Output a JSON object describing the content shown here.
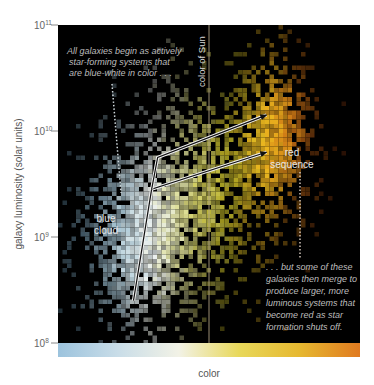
{
  "chart_data": {
    "type": "heatmap",
    "title": "",
    "xlabel": "color",
    "ylabel": "galaxy luminosity (solar units)",
    "y_scale": "log",
    "ylim": [
      100000000.0,
      100000000000.0
    ],
    "xlim": [
      "blue",
      "red"
    ],
    "y_ticks": [
      {
        "base": "10",
        "exp": "8",
        "value": 100000000.0
      },
      {
        "base": "10",
        "exp": "9",
        "value": 1000000000.0
      },
      {
        "base": "10",
        "exp": "10",
        "value": 10000000000.0
      },
      {
        "base": "10",
        "exp": "11",
        "value": 100000000000.0
      }
    ],
    "color_scale": [
      "#9cc3dd",
      "#c9dde8",
      "#f2f2e6",
      "#e8d85a",
      "#e6b830",
      "#e07a20"
    ],
    "regions": [
      {
        "name": "blue cloud",
        "label_lines": [
          "blue",
          "cloud"
        ],
        "color_position": 0.28,
        "log_luminosity": 9.15
      },
      {
        "name": "red sequence",
        "label_lines": [
          "red",
          "sequence"
        ],
        "color_position": 0.78,
        "log_luminosity": 9.75
      }
    ],
    "reference_lines": [
      {
        "name": "color of Sun",
        "color_position": 0.5
      }
    ],
    "annotations": [
      {
        "id": "blue-start",
        "lines": [
          "All galaxies begin as actively",
          "star-forming systems that",
          "are blue-white in color . . ."
        ]
      },
      {
        "id": "red-merge",
        "lines": [
          ". . . but some of these",
          "galaxies then merge to",
          "produce larger, more",
          "luminous systems that",
          "become red as star",
          "formation shuts off."
        ]
      }
    ],
    "evolution_arrows": [
      {
        "from": {
          "color_position": 0.25,
          "log_luminosity": 8.4
        },
        "via": {
          "color_position": 0.31,
          "log_luminosity": 9.45
        },
        "to": {
          "color_position": 0.69,
          "log_luminosity": 9.8
        }
      },
      {
        "from": {
          "color_position": 0.31,
          "log_luminosity": 9.45
        },
        "via": {
          "color_position": 0.33,
          "log_luminosity": 9.75
        },
        "to": {
          "color_position": 0.69,
          "log_luminosity": 10.15
        }
      }
    ],
    "density_model": [
      {
        "name": "blue cloud",
        "center_color": 0.26,
        "center_log_lum": 9.0,
        "spread_color": 0.11,
        "spread_log_lum": 0.55,
        "weight": 1.0
      },
      {
        "name": "green valley",
        "center_color": 0.5,
        "center_log_lum": 9.5,
        "spread_color": 0.12,
        "spread_log_lum": 0.6,
        "weight": 0.7
      },
      {
        "name": "red sequence",
        "center_color": 0.72,
        "center_log_lum": 10.0,
        "spread_color": 0.07,
        "spread_log_lum": 0.45,
        "weight": 1.0
      }
    ]
  }
}
